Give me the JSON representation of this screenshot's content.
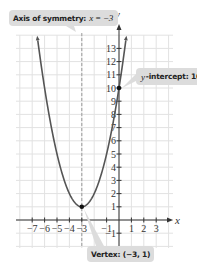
{
  "chart_data": {
    "type": "line",
    "title": "",
    "equation": "y = (x + 3)^2 + 1",
    "xlabel": "x",
    "ylabel": "y",
    "xlim": [
      -8,
      4
    ],
    "ylim": [
      -2,
      14
    ],
    "x_ticks": [
      -7,
      -6,
      -5,
      -4,
      -3,
      -1,
      1,
      2,
      3
    ],
    "x_tick_labels": [
      "−7",
      "−6",
      "−5",
      "−4",
      "−3",
      "−1",
      "1",
      "2",
      "3"
    ],
    "y_ticks": [
      -1,
      1,
      2,
      3,
      4,
      5,
      6,
      7,
      8,
      9,
      10,
      11,
      12,
      13
    ],
    "y_tick_labels": [
      "−1",
      "1",
      "2",
      "3",
      "4",
      "5",
      "6",
      "7",
      "8",
      "9",
      "10",
      "11",
      "12",
      "13"
    ],
    "grid": true,
    "series": [
      {
        "name": "parabola",
        "color": "#555555",
        "x": [
          -6.6,
          -6,
          -5,
          -4,
          -3,
          -2,
          -1,
          0,
          0.6
        ],
        "y": [
          13.96,
          10,
          5,
          2,
          1,
          2,
          5,
          10,
          13.96
        ]
      }
    ],
    "axis_of_symmetry": {
      "x": -3,
      "style": "dashed"
    },
    "points": [
      {
        "name": "vertex",
        "x": -3,
        "y": 1
      },
      {
        "name": "y-intercept",
        "x": 0,
        "y": 10
      }
    ],
    "annotations": [
      {
        "id": "axis",
        "label": "Axis of symmetry:",
        "math": "x = −3"
      },
      {
        "id": "yint",
        "math": "y",
        "label": "-intercept: 10"
      },
      {
        "id": "vertex",
        "label": "Vertex: (−3, 1)"
      }
    ]
  },
  "colors": {
    "grid": "#e2e2e2",
    "axis": "#333333",
    "curve": "#555555",
    "callout_bg": "#dcdcdc",
    "dashed": "#9a9a9a"
  }
}
